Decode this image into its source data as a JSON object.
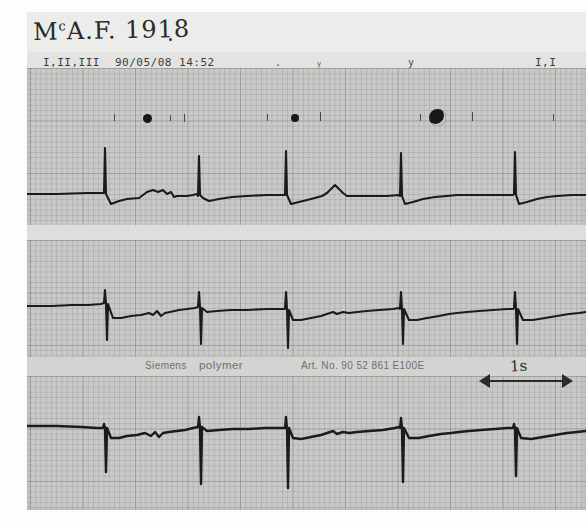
{
  "document": {
    "kind": "ecg-strip-scan",
    "handwritten_id": "MᶜA.F. 1918",
    "handwritten_prefix": "M",
    "handwritten_superscript": "c",
    "handwritten_rest": "A.F. 1918"
  },
  "header": {
    "lead_label": "I,II,III",
    "date": "90/05/08",
    "time": "14:52",
    "right_lead_label": "I,I",
    "tick_a": ".",
    "tick_b": "y",
    "tick_c": "y"
  },
  "manufacturer": {
    "name": "Siemens",
    "brand": "polymer",
    "article": "Art. No. 90 52 861 E100E"
  },
  "scale": {
    "label": "1s",
    "icon_left": "arrow-left",
    "icon_right": "arrow-right"
  },
  "markers": [
    {
      "name": "beat-marker-dot-1",
      "x": 147,
      "y": 118,
      "size": 9,
      "style": "solid"
    },
    {
      "name": "beat-marker-dot-2",
      "x": 295,
      "y": 118,
      "size": 8,
      "style": "solid"
    },
    {
      "name": "beat-marker-ring",
      "x": 437,
      "y": 117,
      "size": 17,
      "style": "ring"
    }
  ],
  "tracelets": [
    {
      "x": 114,
      "y": 114,
      "h": 7
    },
    {
      "x": 170,
      "y": 115,
      "h": 6
    },
    {
      "x": 184,
      "y": 114,
      "h": 8
    },
    {
      "x": 267,
      "y": 114,
      "h": 7
    },
    {
      "x": 320,
      "y": 112,
      "h": 9
    },
    {
      "x": 420,
      "y": 114,
      "h": 7
    },
    {
      "x": 472,
      "y": 112,
      "h": 9
    },
    {
      "x": 553,
      "y": 114,
      "h": 7
    }
  ],
  "chart_data": {
    "type": "line",
    "xlabel": "time",
    "ylabel": "amplitude (mV)",
    "paper_speed": "25 mm/s",
    "time_scale_marker": "1s",
    "grid": true,
    "leads": [
      {
        "name": "I",
        "baseline_y": 182,
        "beats_x": [
          104,
          174,
          260,
          328,
          416,
          487,
          556
        ],
        "morphology": "small-upright-P, narrow tall-R spike, low amplitude",
        "polarity": "positive"
      },
      {
        "name": "II",
        "baseline_y": 295,
        "beats_x": [
          104,
          174,
          260,
          328,
          416,
          487,
          556
        ],
        "morphology": "narrow deep-S spike with small preceding R",
        "polarity": "negative"
      },
      {
        "name": "III",
        "baseline_y": 415,
        "beats_x": [
          104,
          174,
          260,
          328,
          416,
          487,
          556
        ],
        "morphology": "very deep narrow negative spikes",
        "polarity": "negative"
      }
    ]
  }
}
